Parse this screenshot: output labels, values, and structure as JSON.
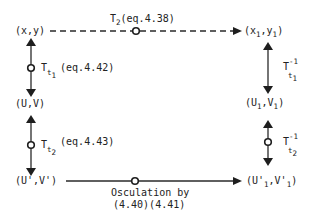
{
  "diagram": {
    "nodes": {
      "xy": {
        "base": "(x,y)"
      },
      "x1y1": {
        "open": "(x",
        "sub1": "1",
        "mid": ",y",
        "sub2": "1",
        "close": ")"
      },
      "UV": {
        "base": "(U,V)"
      },
      "U1V1": {
        "open": "(U",
        "sub1": "1",
        "mid": ",V",
        "sub2": "1",
        "close": ")"
      },
      "UpVp": {
        "base": "(U',V')"
      },
      "Up1Vp1": {
        "open": "(U'",
        "sub1": "1",
        "mid": ",V'",
        "sub2": "1",
        "close": ")"
      }
    },
    "edges": {
      "top": {
        "T": "T",
        "sub": "2",
        "ref": "(eq.4.38)",
        "style": "dashed"
      },
      "left_upper": {
        "T": "T",
        "sub": "t",
        "subsub": "1",
        "ref": "(eq.4.42)"
      },
      "left_lower": {
        "T": "T",
        "sub": "t",
        "subsub": "2",
        "ref": "(eq.4.43)"
      },
      "right_upper": {
        "T": "T",
        "sup": "-1",
        "sub": "t",
        "subsub": "1"
      },
      "right_lower": {
        "T": "T",
        "sup": "-1",
        "sub": "t",
        "subsub": "2"
      },
      "bottom": {
        "line1": "Osculation by",
        "line2": "(4.40)(4.41)",
        "style": "solid"
      }
    }
  }
}
